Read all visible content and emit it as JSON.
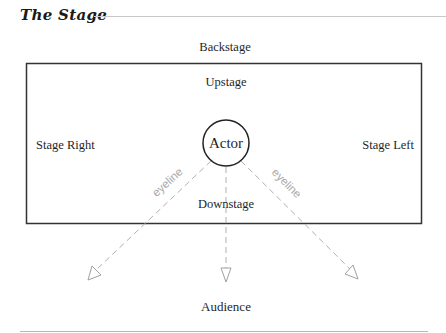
{
  "header": {
    "title": "The Stage"
  },
  "diagram": {
    "labels": {
      "backstage": "Backstage",
      "upstage": "Upstage",
      "stage_right": "Stage Right",
      "stage_left": "Stage Left",
      "actor": "Actor",
      "downstage": "Downstage",
      "audience": "Audience"
    },
    "eyelines": [
      {
        "label": "eyeline",
        "direction": "left"
      },
      {
        "label": "",
        "direction": "center"
      },
      {
        "label": "eyeline",
        "direction": "right"
      }
    ],
    "colors": {
      "stroke": "#333333",
      "dashed": "#b0b0b0",
      "text": "#1f1f1f",
      "eyeline_text": "#aaaaaa"
    }
  }
}
